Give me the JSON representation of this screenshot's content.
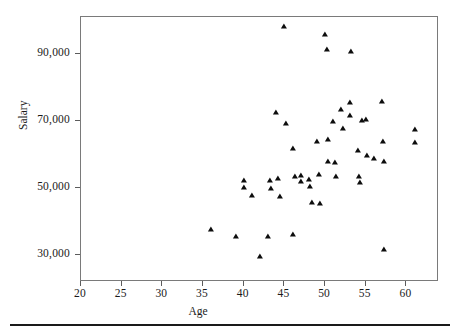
{
  "chart_data": {
    "type": "scatter",
    "title": "",
    "xlabel": "Age",
    "ylabel": "Salary",
    "xlim": [
      20,
      64
    ],
    "ylim": [
      22000,
      101000
    ],
    "grid": false,
    "legend": null,
    "marker": "triangle",
    "marker_color": "#0d0d0d",
    "xticks": [
      20,
      25,
      30,
      35,
      40,
      45,
      50,
      55,
      60
    ],
    "xtick_labels": [
      "20",
      "25",
      "30",
      "35",
      "40",
      "45",
      "50",
      "55",
      "60"
    ],
    "yticks": [
      30000,
      50000,
      70000,
      90000
    ],
    "ytick_labels": [
      "30,000",
      "50,000",
      "70,000",
      "90,000"
    ],
    "points": [
      {
        "x": 36.0,
        "y": 37500
      },
      {
        "x": 39.0,
        "y": 35300
      },
      {
        "x": 40.0,
        "y": 52200
      },
      {
        "x": 40.0,
        "y": 50100
      },
      {
        "x": 41.0,
        "y": 47500
      },
      {
        "x": 42.0,
        "y": 29600
      },
      {
        "x": 43.0,
        "y": 35300
      },
      {
        "x": 43.2,
        "y": 52000
      },
      {
        "x": 43.3,
        "y": 49600
      },
      {
        "x": 44.0,
        "y": 72300
      },
      {
        "x": 44.2,
        "y": 52600
      },
      {
        "x": 44.4,
        "y": 47300
      },
      {
        "x": 45.0,
        "y": 97900
      },
      {
        "x": 45.2,
        "y": 69200
      },
      {
        "x": 46.0,
        "y": 36000
      },
      {
        "x": 46.1,
        "y": 61700
      },
      {
        "x": 46.3,
        "y": 53300
      },
      {
        "x": 47.0,
        "y": 53600
      },
      {
        "x": 47.1,
        "y": 51800
      },
      {
        "x": 48.0,
        "y": 52300
      },
      {
        "x": 48.2,
        "y": 50200
      },
      {
        "x": 48.4,
        "y": 45600
      },
      {
        "x": 49.0,
        "y": 63700
      },
      {
        "x": 49.2,
        "y": 54000
      },
      {
        "x": 49.4,
        "y": 45200
      },
      {
        "x": 50.0,
        "y": 95700
      },
      {
        "x": 50.2,
        "y": 91200
      },
      {
        "x": 50.3,
        "y": 64300
      },
      {
        "x": 50.4,
        "y": 57900
      },
      {
        "x": 51.0,
        "y": 69700
      },
      {
        "x": 51.2,
        "y": 57600
      },
      {
        "x": 51.4,
        "y": 53200
      },
      {
        "x": 52.0,
        "y": 73400
      },
      {
        "x": 52.2,
        "y": 67700
      },
      {
        "x": 53.0,
        "y": 75300
      },
      {
        "x": 53.1,
        "y": 71600
      },
      {
        "x": 53.2,
        "y": 90500
      },
      {
        "x": 54.0,
        "y": 61100
      },
      {
        "x": 54.2,
        "y": 53200
      },
      {
        "x": 54.3,
        "y": 51600
      },
      {
        "x": 54.5,
        "y": 70100
      },
      {
        "x": 55.0,
        "y": 70400
      },
      {
        "x": 55.2,
        "y": 59700
      },
      {
        "x": 56.0,
        "y": 58600
      },
      {
        "x": 57.0,
        "y": 75600
      },
      {
        "x": 57.1,
        "y": 63600
      },
      {
        "x": 57.2,
        "y": 57700
      },
      {
        "x": 57.3,
        "y": 31400
      },
      {
        "x": 61.0,
        "y": 67200
      },
      {
        "x": 61.1,
        "y": 63400
      }
    ]
  }
}
